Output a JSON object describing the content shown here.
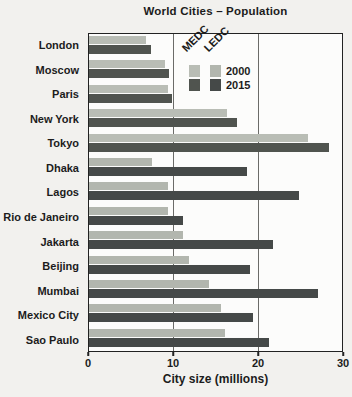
{
  "chart_data": {
    "type": "bar",
    "orientation": "horizontal",
    "title": "World Cities – Population",
    "xlabel": "City size (millions)",
    "xlim": [
      0,
      30
    ],
    "xticks": [
      0,
      10,
      20,
      30
    ],
    "gridlines": [
      10,
      20
    ],
    "grid": true,
    "legend_position": "top-right-inside",
    "categories": [
      "London",
      "Moscow",
      "Paris",
      "New York",
      "Tokyo",
      "Dhaka",
      "Lagos",
      "Rio de Janeiro",
      "Jakarta",
      "Beijing",
      "Mumbai",
      "Mexico City",
      "Sao Paulo"
    ],
    "city_types": [
      "MEDC",
      "MEDC",
      "MEDC",
      "MEDC",
      "MEDC",
      "LEDC",
      "LEDC",
      "LEDC",
      "LEDC",
      "LEDC",
      "LEDC",
      "LEDC",
      "LEDC"
    ],
    "series": [
      {
        "name": "2000",
        "values": [
          6.7,
          9.0,
          9.4,
          16.4,
          26.0,
          7.5,
          9.4,
          9.4,
          11.1,
          11.8,
          14.2,
          15.6,
          16.1
        ]
      },
      {
        "name": "2015",
        "values": [
          7.3,
          9.5,
          9.8,
          17.6,
          28.5,
          18.7,
          24.9,
          11.2,
          21.8,
          19.1,
          27.2,
          19.4,
          21.3
        ]
      }
    ],
    "legend": {
      "columns": [
        "MEDC",
        "LEDC"
      ],
      "rows": [
        "2000",
        "2015"
      ]
    },
    "colors": {
      "MEDC_2000": "#b9bdb5",
      "LEDC_2000": "#b2b6ae",
      "MEDC_2015": "#50544f",
      "LEDC_2015": "#454948",
      "border": "#222222",
      "gridline": "#6b6b68",
      "background": "#f2f1ee",
      "plot_background": "#fcfcfb"
    }
  }
}
